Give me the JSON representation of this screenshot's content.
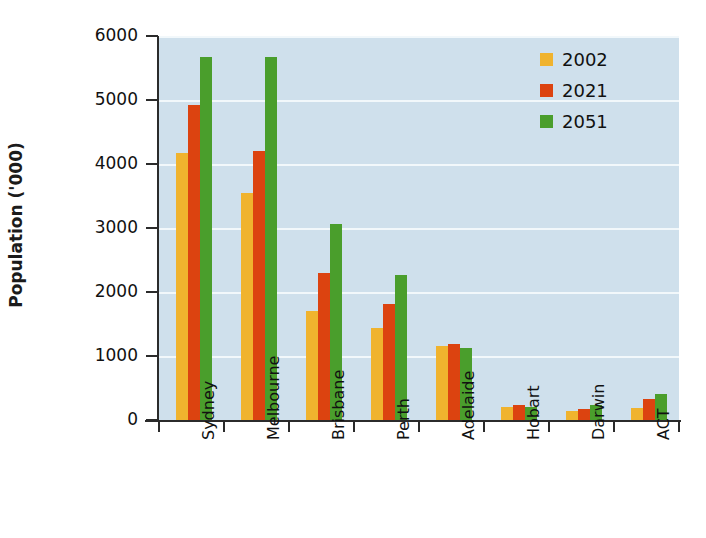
{
  "chart_data": {
    "type": "bar",
    "title": "",
    "subtitle": "",
    "xlabel": "",
    "ylabel": "Population ('000)",
    "categories": [
      "Sydney",
      "Melbourne",
      "Brisbane",
      "Perth",
      "Adelaide",
      "Hobart",
      "Darwin",
      "ACT"
    ],
    "series": [
      {
        "name": "2002",
        "color": "#f0b32e",
        "values": [
          4170,
          3550,
          1700,
          1440,
          1160,
          200,
          135,
          195
        ]
      },
      {
        "name": "2021",
        "color": "#dc4310",
        "values": [
          4915,
          4200,
          2300,
          1820,
          1195,
          230,
          175,
          325
        ]
      },
      {
        "name": "2051",
        "color": "#4a9e2c",
        "values": [
          5665,
          5665,
          3060,
          2270,
          1130,
          205,
          235,
          400
        ]
      }
    ],
    "ylim": [
      0,
      6000
    ],
    "yticks": [
      0,
      1000,
      2000,
      3000,
      4000,
      5000,
      6000
    ],
    "ytick_labels": [
      "0",
      "1000",
      "2000",
      "3000",
      "4000",
      "5000",
      "6000"
    ],
    "grid": "horizontal",
    "legend_position": "top-right",
    "plot_background": "#cfe0ec",
    "gridline_color": "#f2f8fb",
    "axis_color": "#2b2b2b"
  }
}
